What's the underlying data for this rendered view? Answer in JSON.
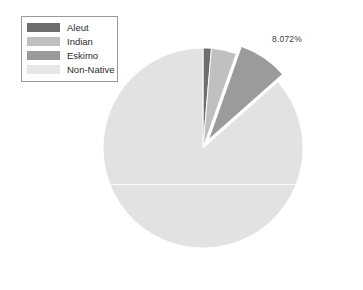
{
  "chart_data": {
    "type": "pie",
    "title": "",
    "subtitle": "",
    "xlabel": "",
    "ylabel": "",
    "grid": false,
    "legend_position": "top-left",
    "categories": [
      "Aleut",
      "Indian",
      "Eskimo",
      "Non-Native"
    ],
    "values": [
      1.35,
      4.05,
      8.072,
      86.528
    ],
    "slices": [
      {
        "label": "Aleut",
        "value": 1.35,
        "color": "#6e6e6e",
        "exploded": false,
        "start_angle_deg": 0,
        "end_angle_deg": 4.86,
        "data_label": ""
      },
      {
        "label": "Indian",
        "value": 4.05,
        "color": "#c0c0c0",
        "exploded": false,
        "start_angle_deg": 4.86,
        "end_angle_deg": 19.44,
        "data_label": ""
      },
      {
        "label": "Eskimo",
        "value": 8.072,
        "color": "#9b9b9b",
        "exploded": true,
        "start_angle_deg": 19.44,
        "end_angle_deg": 48.5,
        "data_label": "8.072%"
      },
      {
        "label": "Non-Native",
        "value": 86.528,
        "color": "#e2e2e2",
        "exploded": false,
        "start_angle_deg": 48.5,
        "end_angle_deg": 360,
        "data_label": ""
      }
    ],
    "annotations": [
      {
        "text": "8.072%",
        "target": "Eskimo"
      }
    ]
  },
  "legend": {
    "items": [
      {
        "label": "Aleut",
        "color": "#6e6e6e"
      },
      {
        "label": "Indian",
        "color": "#c0c0c0"
      },
      {
        "label": "Eskimo",
        "color": "#9b9b9b"
      },
      {
        "label": "Non-Native",
        "color": "#e6e6e6"
      }
    ]
  },
  "geometry": {
    "center_x": 203,
    "center_y": 148,
    "radius": 100,
    "explode_offset": 9
  },
  "colors": {
    "background": "#ffffff",
    "legend_border": "#9a9a9a",
    "label_text": "#3c3c3c",
    "slice_separator": "#ffffff"
  }
}
